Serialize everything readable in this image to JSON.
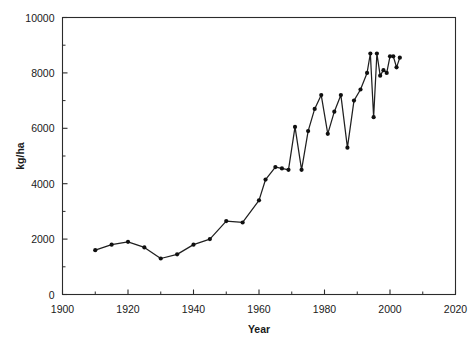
{
  "chart_data": {
    "type": "line",
    "title": "",
    "subtitle": "",
    "xlabel": "Year",
    "ylabel": "kg/ha",
    "xlim": [
      1900,
      2020
    ],
    "ylim": [
      0,
      10000
    ],
    "grid": false,
    "legend": false,
    "legend_position": "none",
    "x_major_ticks": [
      1900,
      1920,
      1940,
      1960,
      1980,
      2000,
      2020
    ],
    "x_major_tick_labels": [
      "1900",
      "1920",
      "1940",
      "1960",
      "1980",
      "2000",
      "2020"
    ],
    "x_minor_ticks": [
      1910,
      1930,
      1950,
      1970,
      1990,
      2010
    ],
    "y_major_ticks": [
      0,
      2000,
      4000,
      6000,
      8000,
      10000
    ],
    "y_major_tick_labels": [
      "0",
      "2000",
      "4000",
      "6000",
      "8000",
      "10000"
    ],
    "y_minor_ticks": [
      1000,
      3000,
      5000,
      7000,
      9000
    ],
    "marker": "filled-circle",
    "line_color": "#202020",
    "marker_color": "#101010",
    "series": [
      {
        "name": "yield",
        "x": [
          1910,
          1915,
          1920,
          1925,
          1930,
          1935,
          1940,
          1945,
          1950,
          1955,
          1960,
          1962,
          1965,
          1967,
          1969,
          1971,
          1973,
          1975,
          1977,
          1979,
          1981,
          1983,
          1985,
          1987,
          1989,
          1991,
          1993,
          1994,
          1995,
          1996,
          1997,
          1998,
          1999,
          2000,
          2001,
          2002,
          2003
        ],
        "y": [
          1600,
          1800,
          1900,
          1700,
          1300,
          1450,
          1800,
          2000,
          2650,
          2600,
          3400,
          4150,
          4600,
          4550,
          4500,
          6050,
          4500,
          5900,
          6700,
          7200,
          5800,
          6600,
          7200,
          5300,
          7000,
          7400,
          8000,
          8700,
          6400,
          8700,
          7900,
          8100,
          8000,
          8600,
          8600,
          8200,
          8550
        ]
      }
    ]
  },
  "axes": {
    "x_title": "Year",
    "y_title": "kg/ha"
  }
}
